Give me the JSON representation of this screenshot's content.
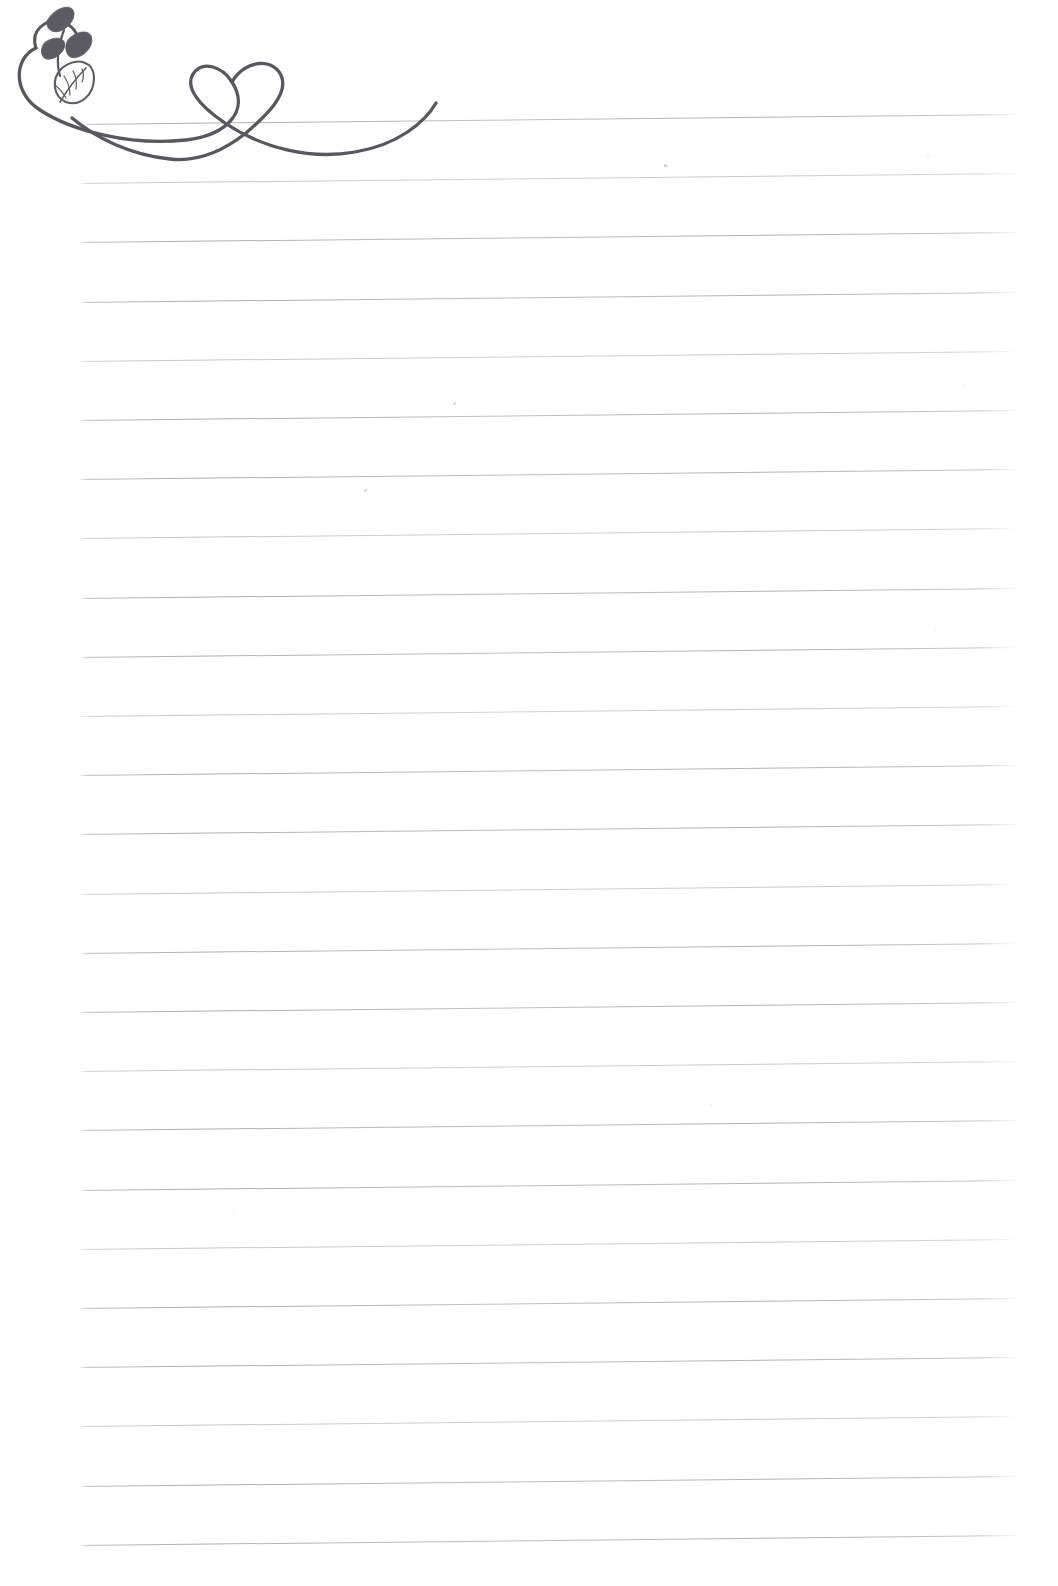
{
  "document": {
    "type": "scanned-lined-notebook-page",
    "title": "Lined Notebook Page",
    "background_color": "#ffffff",
    "width": 1058,
    "height": 1586,
    "body_text": "",
    "bottom_mark_text": ""
  },
  "ruled_lines": {
    "count": 25,
    "color": "#96969c",
    "left_x": 78,
    "right_x": 1018,
    "first_line_y": 124,
    "spacing": 59.2,
    "slant_rise_px": -10,
    "description": "Faint gray horizontal ruled lines slanting slightly upward toward the right"
  },
  "flourish": {
    "name": "vine-heart-swoosh",
    "description": "Hand-drawn decorative flourish: a spiral vine with leaves at far left, flowing into a long swoosh that crosses itself to form a heart, ending in an upward curl",
    "color": "#57575d",
    "stroke_width": 3.2,
    "parts": [
      {
        "name": "vine-spiral",
        "label": "Vine spiral"
      },
      {
        "name": "leaf-small-top",
        "label": "Small leaf (top)"
      },
      {
        "name": "leaf-small-left",
        "label": "Small leaf (left)"
      },
      {
        "name": "leaf-small-right",
        "label": "Small leaf (right)"
      },
      {
        "name": "leaf-large-veined",
        "label": "Large veined leaf"
      },
      {
        "name": "heart",
        "label": "Heart"
      },
      {
        "name": "swoosh-tail",
        "label": "Swoosh tail"
      }
    ]
  },
  "specks": [
    {
      "x": 664,
      "y": 164,
      "size": 3.0,
      "opacity": 0.55
    },
    {
      "x": 453,
      "y": 402,
      "size": 3.0,
      "opacity": 0.45
    },
    {
      "x": 364,
      "y": 489,
      "size": 2.6,
      "opacity": 0.35
    },
    {
      "x": 927,
      "y": 155,
      "size": 2.2,
      "opacity": 0.22
    },
    {
      "x": 963,
      "y": 385,
      "size": 2.0,
      "opacity": 0.2
    },
    {
      "x": 934,
      "y": 628,
      "size": 2.0,
      "opacity": 0.18
    },
    {
      "x": 710,
      "y": 1104,
      "size": 2.0,
      "opacity": 0.16
    },
    {
      "x": 232,
      "y": 1210,
      "size": 2.0,
      "opacity": 0.15
    }
  ]
}
